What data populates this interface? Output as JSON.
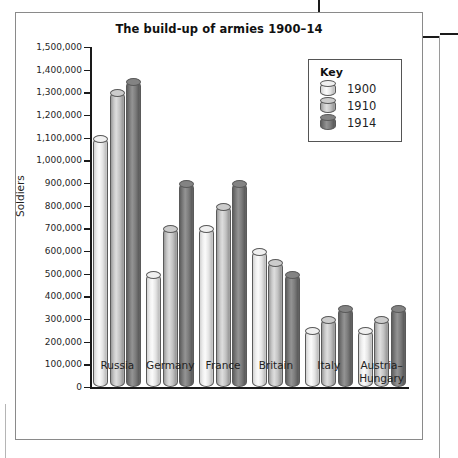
{
  "figure": {
    "title": "The build-up of armies 1900–14"
  },
  "legend": {
    "title": "Key",
    "entries": [
      {
        "label": "1900",
        "color": "#efefef"
      },
      {
        "label": "1910",
        "color": "#c8c8c8"
      },
      {
        "label": "1914",
        "color": "#7d7d7d"
      }
    ]
  },
  "axes": {
    "y_title": "Soldiers",
    "y_ticks": [
      "1,500,000",
      "1,400,000",
      "1,300,000",
      "1,200,000",
      "1,100,000",
      "1,000,000",
      "900,000",
      "800,000",
      "700,000",
      "600,000",
      "500,000",
      "400,000",
      "300,000",
      "200,000",
      "100,000",
      "0"
    ]
  },
  "chart_data": {
    "type": "bar",
    "title": "The build-up of armies 1900–14",
    "xlabel": "",
    "ylabel": "Soldiers",
    "ylim": [
      0,
      1500000
    ],
    "ytick_step": 100000,
    "grid": false,
    "legend_position": "top-right",
    "categories": [
      "Russia",
      "Germany",
      "France",
      "Britain",
      "Italy",
      "Austria–Hungary"
    ],
    "series": [
      {
        "name": "1900",
        "values": [
          1100000,
          500000,
          700000,
          600000,
          250000,
          250000
        ]
      },
      {
        "name": "1910",
        "values": [
          1300000,
          700000,
          800000,
          550000,
          300000,
          300000
        ]
      },
      {
        "name": "1914",
        "values": [
          1350000,
          900000,
          900000,
          500000,
          350000,
          350000
        ]
      }
    ]
  }
}
